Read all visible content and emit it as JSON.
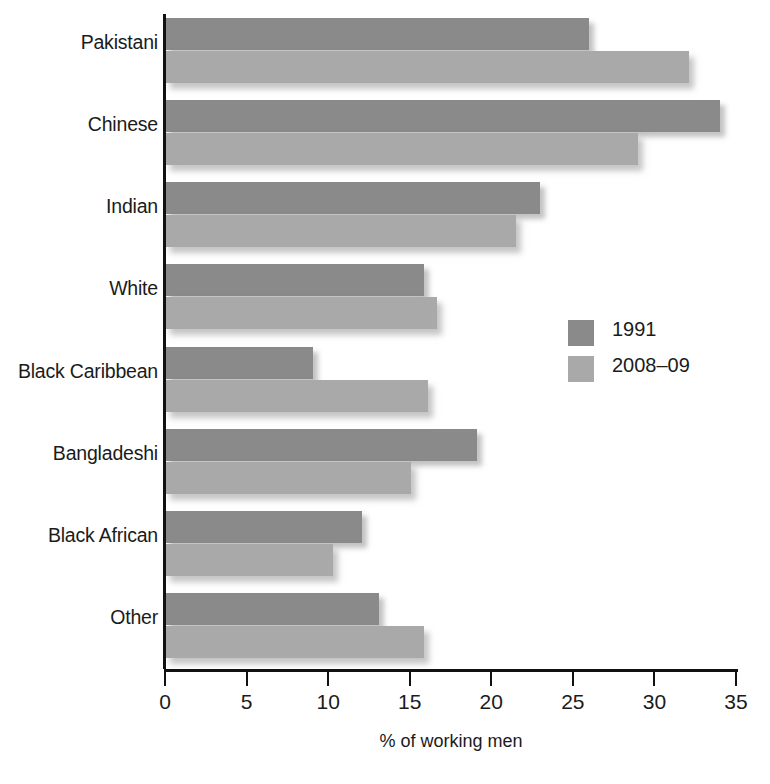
{
  "chart_data": {
    "type": "bar",
    "orientation": "horizontal",
    "title": "",
    "subtitle": "",
    "xlabel": "% of working men",
    "ylabel": "",
    "xlim": [
      0,
      35
    ],
    "xticks": [
      0,
      5,
      10,
      15,
      20,
      25,
      30,
      35
    ],
    "xtick_labels": [
      "0",
      "5",
      "10",
      "15",
      "20",
      "25",
      "30",
      "35"
    ],
    "grid": false,
    "legend_position": "center-right",
    "categories": [
      "Pakistani",
      "Chinese",
      "Indian",
      "White",
      "Black Caribbean",
      "Bangladeshi",
      "Black African",
      "Other"
    ],
    "series": [
      {
        "name": "1991",
        "color": "#8a8a8a",
        "values": [
          26.0,
          34.0,
          23.0,
          15.9,
          9.1,
          19.1,
          12.1,
          13.1
        ]
      },
      {
        "name": "2008–09",
        "color": "#a9a9a9",
        "values": [
          32.1,
          29.0,
          21.5,
          16.7,
          16.1,
          15.1,
          10.3,
          15.9
        ]
      }
    ]
  },
  "axis": {
    "x_title": "% of working men"
  },
  "legend": {
    "items": [
      {
        "label": "1991",
        "color": "#8a8a8a"
      },
      {
        "label": "2008–09",
        "color": "#a9a9a9"
      }
    ]
  }
}
